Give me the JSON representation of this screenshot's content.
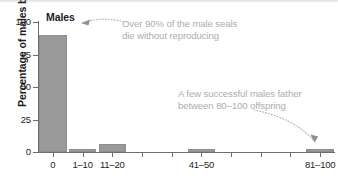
{
  "chart_data": {
    "type": "bar",
    "title": "Males",
    "xlabel": "",
    "ylabel": "Percentage of males born",
    "ylim": [
      0,
      100
    ],
    "yticks": [
      0,
      25,
      50,
      75,
      100
    ],
    "ytick_labels": [
      "0",
      "25",
      "50",
      "75",
      "100"
    ],
    "grid": false,
    "legend": false,
    "categories": [
      "0",
      "1–10",
      "11–20",
      "21–30",
      "31–40",
      "41–50",
      "51–60",
      "61–70",
      "71–80",
      "81–100"
    ],
    "visible_tick_labels": [
      "0",
      "1–10",
      "11–20",
      "41–50",
      "81–100"
    ],
    "values": [
      90,
      2,
      6,
      0,
      0,
      2,
      0,
      0,
      0,
      2
    ],
    "bar_color": "#9a9a9a",
    "annotations": [
      {
        "id": "high-mortality",
        "text_line1": "Over 90% of the male seals",
        "text_line2": "die without reproducing",
        "points_to": "0"
      },
      {
        "id": "successful-males",
        "text_line1": "A few successful males father",
        "text_line2": "between 80–100 offspring",
        "points_to": "81–100"
      }
    ],
    "annotation_color": "#adadad",
    "axis_color": "#6e6e6e",
    "text_color": "#1d1d1d"
  },
  "axis": {
    "y_title": "Percentage of males born",
    "ticks": {
      "y": [
        "0",
        "25",
        "50",
        "75",
        "100"
      ],
      "x": [
        "0",
        "1–10",
        "11–20",
        "41–50",
        "81–100"
      ]
    }
  },
  "title": "Males"
}
